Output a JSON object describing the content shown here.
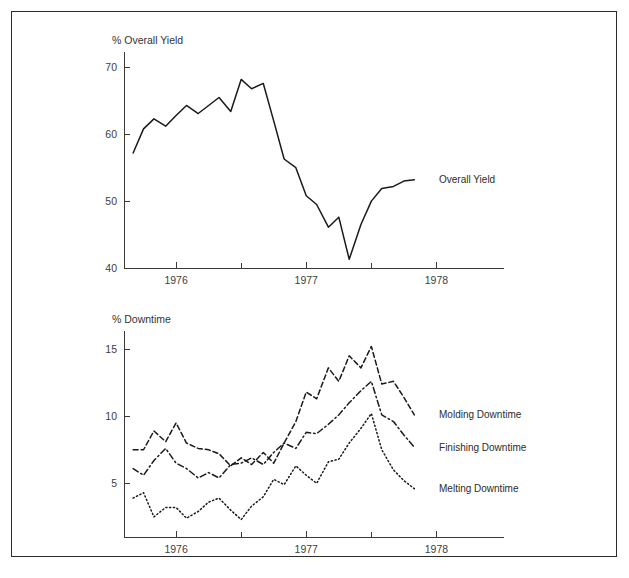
{
  "figure": {
    "border_color": "#2b2b2b",
    "background": "#ffffff"
  },
  "chart_data": [
    {
      "type": "line",
      "panel": "top",
      "title": "",
      "ylabel": "% Overall Yield",
      "xlabel": "",
      "ylim": [
        40,
        72
      ],
      "yticks": [
        40,
        50,
        60,
        70
      ],
      "ytick_labels": [
        "40",
        "50",
        "60",
        "70"
      ],
      "xlim": [
        1975.6,
        1978.35
      ],
      "xticks": [
        1976,
        1977,
        1978
      ],
      "xtick_labels": [
        "1976",
        "1977",
        "1978"
      ],
      "xminor_ticks": [
        1976.5,
        1977.5
      ],
      "grid": false,
      "legend_position": "inline-right",
      "series": [
        {
          "name": "Overall Yield",
          "style": "solid",
          "label_x": 1978.02,
          "label_y": 53.2,
          "x": [
            1975.67,
            1975.75,
            1975.83,
            1975.92,
            1976.0,
            1976.08,
            1976.17,
            1976.25,
            1976.33,
            1976.42,
            1976.5,
            1976.58,
            1976.67,
            1976.75,
            1976.83,
            1976.92,
            1977.0,
            1977.08,
            1977.17,
            1977.25,
            1977.33,
            1977.42,
            1977.5,
            1977.58,
            1977.67,
            1977.75,
            1977.83
          ],
          "values": [
            57.2,
            60.8,
            62.3,
            61.2,
            62.8,
            64.3,
            63.1,
            64.3,
            65.5,
            63.4,
            68.2,
            66.8,
            67.6,
            62.0,
            56.3,
            55.0,
            50.8,
            49.5,
            46.1,
            47.6,
            41.3,
            46.5,
            50.0,
            51.9,
            52.2,
            53.0,
            53.2
          ]
        }
      ]
    },
    {
      "type": "line",
      "panel": "bottom",
      "title": "",
      "ylabel": "% Downtime",
      "xlabel": "",
      "ylim": [
        1.0,
        16.2
      ],
      "yticks": [
        5,
        10,
        15
      ],
      "ytick_labels": [
        "5",
        "10",
        "15"
      ],
      "xlim": [
        1975.6,
        1978.35
      ],
      "xticks": [
        1976,
        1977,
        1978
      ],
      "xtick_labels": [
        "1976",
        "1977",
        "1978"
      ],
      "xminor_ticks": [
        1976.5,
        1977.5
      ],
      "grid": false,
      "legend_position": "inline-right",
      "x": [
        1975.67,
        1975.75,
        1975.83,
        1975.92,
        1976.0,
        1976.08,
        1976.17,
        1976.25,
        1976.33,
        1976.42,
        1976.5,
        1976.58,
        1976.67,
        1976.75,
        1976.83,
        1976.92,
        1977.0,
        1977.08,
        1977.17,
        1977.25,
        1977.33,
        1977.42,
        1977.5,
        1977.58,
        1977.67,
        1977.75,
        1977.83
      ],
      "series": [
        {
          "name": "Molding Downtime",
          "style": "dashed",
          "label_x": 1978.02,
          "label_y": 10.1,
          "values": [
            7.5,
            7.5,
            8.9,
            8.1,
            9.5,
            8.0,
            7.6,
            7.5,
            7.2,
            6.3,
            6.9,
            6.4,
            7.3,
            6.5,
            8.0,
            9.6,
            11.8,
            11.3,
            13.6,
            12.6,
            14.5,
            13.6,
            15.2,
            12.4,
            12.6,
            11.4,
            10.1
          ]
        },
        {
          "name": "Finishing Downtime",
          "style": "dashdot",
          "label_x": 1978.02,
          "label_y": 7.7,
          "values": [
            6.1,
            5.6,
            6.7,
            7.6,
            6.5,
            6.1,
            5.4,
            5.8,
            5.4,
            6.4,
            6.5,
            6.9,
            6.4,
            7.3,
            8.0,
            7.6,
            8.8,
            8.7,
            9.4,
            10.1,
            11.0,
            11.9,
            12.6,
            10.1,
            9.6,
            8.6,
            7.7
          ]
        },
        {
          "name": "Melting Downtime",
          "style": "dotted",
          "label_x": 1978.02,
          "label_y": 4.6,
          "values": [
            3.9,
            4.3,
            2.5,
            3.2,
            3.2,
            2.4,
            2.9,
            3.6,
            3.9,
            3.0,
            2.3,
            3.3,
            4.0,
            5.3,
            4.9,
            6.3,
            5.6,
            5.0,
            6.6,
            6.8,
            8.0,
            9.1,
            10.2,
            7.5,
            6.0,
            5.2,
            4.6
          ]
        }
      ]
    }
  ]
}
